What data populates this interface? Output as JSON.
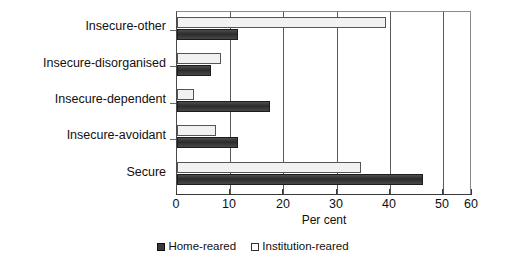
{
  "chart_data": {
    "type": "bar",
    "orientation": "horizontal",
    "title": "",
    "xlabel": "Per cent",
    "ylabel": "",
    "xlim": [
      0,
      60
    ],
    "xticks": [
      0,
      10,
      20,
      30,
      40,
      50,
      60
    ],
    "grid": true,
    "grid_axis": "x",
    "legend_position": "bottom",
    "categories": [
      "Insecure-other",
      "Insecure-disorganised",
      "Insecure-dependent",
      "Insecure-avoidant",
      "Secure"
    ],
    "series": [
      {
        "name": "Home-reared",
        "color": "#3a3a3a",
        "values": [
          12.5,
          7,
          19,
          12.5,
          50
        ]
      },
      {
        "name": "Institution-reared",
        "color": "#ffffff",
        "values": [
          42.5,
          9,
          3.5,
          8,
          37.5
        ]
      }
    ]
  },
  "axis": {
    "x_title": "Per cent",
    "tick_labels": [
      "0",
      "10",
      "20",
      "30",
      "40",
      "50",
      "60"
    ]
  },
  "legend": {
    "items": [
      {
        "label": "Home-reared",
        "swatch": "filled-square-icon"
      },
      {
        "label": "Institution-reared",
        "swatch": "empty-square-icon"
      }
    ]
  }
}
